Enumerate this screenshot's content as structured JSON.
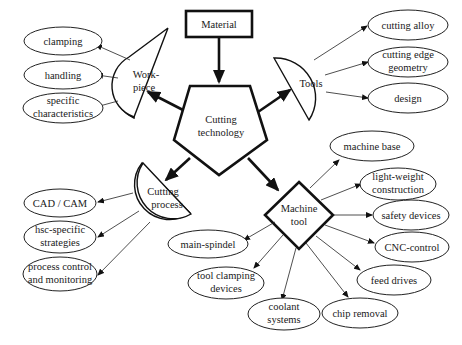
{
  "diagram": {
    "center": {
      "line1": "Cutting",
      "line2": "technology"
    },
    "input": {
      "label": "Material"
    },
    "categories": {
      "workpiece": {
        "line1": "Work-",
        "line2": "piece",
        "items": [
          {
            "line1": "clamping"
          },
          {
            "line1": "handling"
          },
          {
            "line1": "specific",
            "line2": "characteristics"
          }
        ]
      },
      "tools": {
        "line1": "Tools",
        "items": [
          {
            "line1": "cutting alloy"
          },
          {
            "line1": "cutting edge",
            "line2": "geometry"
          },
          {
            "line1": "design"
          }
        ]
      },
      "cutting_process": {
        "line1": "Cutting",
        "line2": "process",
        "items": [
          {
            "line1": "CAD / CAM"
          },
          {
            "line1": "hsc-specific",
            "line2": "strategies"
          },
          {
            "line1": "process control",
            "line2": "and monitoring"
          }
        ]
      },
      "machine_tool": {
        "line1": "Machine",
        "line2": "tool",
        "items": [
          {
            "line1": "machine base"
          },
          {
            "line1": "light-weight",
            "line2": "construction"
          },
          {
            "line1": "safety devices"
          },
          {
            "line1": "CNC-control"
          },
          {
            "line1": "feed drives"
          },
          {
            "line1": "chip removal"
          },
          {
            "line1": "coolant",
            "line2": "systems"
          },
          {
            "line1": "tool clamping",
            "line2": "devices"
          },
          {
            "line1": "main-spindel"
          }
        ]
      }
    }
  },
  "colors": {
    "stroke": "#111111",
    "background": "#ffffff",
    "text": "#1a1a1a"
  }
}
